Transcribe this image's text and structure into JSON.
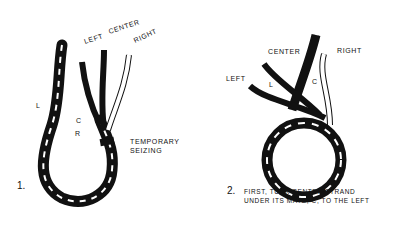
{
  "figure1": {
    "number": "1.",
    "labels": {
      "left": "LEFT",
      "center": "CENTER",
      "right": "RIGHT",
      "l": "L",
      "c": "C",
      "r": "R",
      "seizing_line1": "TEMPORARY",
      "seizing_line2": "SEIZING"
    }
  },
  "figure2": {
    "number": "2.",
    "labels": {
      "center": "CENTER",
      "right": "RIGHT",
      "left": "LEFT",
      "l": "L",
      "c": "C"
    },
    "caption_line1": "FIRST, TUCK CENTER STRAND",
    "caption_line2": "UNDER ITS MATE, C, TO THE LEFT"
  },
  "colors": {
    "ink": "#111111",
    "paper": "#ffffff"
  }
}
